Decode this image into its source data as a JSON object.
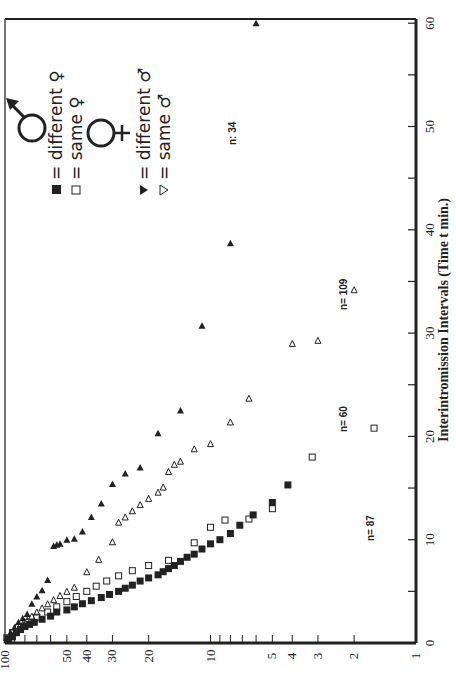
{
  "chart_data": {
    "type": "scatter",
    "orientation": "rotated 90° clockwise (time axis vertical on right edge, percent axis horizontal along bottom)",
    "title": "",
    "xlabel": "Interintromission Intervals (Time t min.)",
    "ylabel": "",
    "xlim": [
      0,
      60
    ],
    "ylim": [
      1,
      100
    ],
    "yscale": "log",
    "x_ticks": [
      0,
      10,
      20,
      30,
      40,
      50,
      60
    ],
    "y_ticks": [
      100,
      50,
      40,
      30,
      20,
      10,
      5,
      4,
      3,
      2,
      1
    ],
    "grid": false,
    "legend": [
      {
        "symbol": "filled-square",
        "label": "= different ♀",
        "group": "male"
      },
      {
        "symbol": "open-square",
        "label": "= same ♀",
        "group": "male"
      },
      {
        "symbol": "filled-triangle",
        "label": "= different ♂",
        "group": "female"
      },
      {
        "symbol": "open-triangle",
        "label": "= same ♂",
        "group": "female"
      }
    ],
    "annotations": [
      "n= 87",
      "n= 60",
      "n=109",
      "n= 34"
    ],
    "series": [
      {
        "name": "different ♀ (male)",
        "marker": "filled-square",
        "n": 87,
        "x": [
          0.3,
          0.6,
          1,
          1.3,
          1.6,
          1.8,
          2,
          2.3,
          2.6,
          3,
          3.2,
          3.5,
          3.8,
          4.1,
          4.4,
          4.7,
          5,
          5.3,
          5.6,
          6,
          6.3,
          6.6,
          6.9,
          7.2,
          7.5,
          7.9,
          8.3,
          8.6,
          9.1,
          9.6,
          10,
          10.6,
          11.4,
          12.4,
          13.6,
          15.3
        ],
        "y": [
          96,
          92,
          88,
          84,
          80,
          76,
          72,
          66,
          60,
          56,
          50,
          46,
          42,
          38,
          34,
          31,
          28,
          26,
          24,
          22,
          20,
          18,
          17,
          16,
          15,
          14,
          13,
          12,
          11,
          10,
          9,
          8,
          7.2,
          6.2,
          5,
          4.2
        ]
      },
      {
        "name": "same ♀ (male)",
        "marker": "open-square",
        "n": 60,
        "x": [
          0.5,
          1,
          1.5,
          2,
          2.5,
          3,
          3.5,
          4,
          4.5,
          5,
          5.5,
          6,
          6.5,
          7,
          7.5,
          8,
          9.7,
          11.2,
          11.9,
          12,
          13,
          18,
          20.8
        ],
        "y": [
          98,
          92,
          86,
          78,
          70,
          62,
          56,
          50,
          45,
          40,
          36,
          32,
          28,
          24,
          20,
          16,
          12,
          10,
          8.5,
          6.5,
          5,
          3.2,
          1.6
        ]
      },
      {
        "name": "different ♂ (female)",
        "marker": "filled-triangle",
        "n": 34,
        "x": [
          0.5,
          1,
          1.5,
          2,
          2.4,
          2.8,
          3.8,
          4.5,
          5.1,
          6.1,
          9.4,
          9.5,
          9.6,
          10,
          10.1,
          10.8,
          12.2,
          13.5,
          15.4,
          16.4,
          17,
          20.3,
          22.5,
          30.7,
          38.7,
          60
        ],
        "y": [
          98,
          94,
          90,
          86,
          82,
          78,
          74,
          70,
          66,
          62,
          58,
          56,
          54,
          50,
          46,
          42,
          38,
          34,
          30,
          26,
          22,
          18,
          14,
          11,
          8,
          6
        ]
      },
      {
        "name": "same ♂ (female)",
        "marker": "open-triangle",
        "n": 109,
        "x": [
          0.3,
          0.7,
          1,
          1.4,
          1.8,
          2.2,
          2.6,
          3,
          3.4,
          3.8,
          4.2,
          4.6,
          5,
          5.4,
          6.9,
          8.1,
          9.8,
          11.7,
          12.2,
          12.8,
          13.4,
          14,
          14.6,
          15.1,
          16.6,
          17.3,
          17.6,
          18.8,
          19.3,
          21.4,
          23.7,
          29,
          29.3,
          34.2
        ],
        "y": [
          98,
          94,
          90,
          86,
          82,
          78,
          74,
          70,
          66,
          62,
          58,
          54,
          50,
          46,
          40,
          35,
          30,
          28,
          26,
          24,
          22,
          20,
          18,
          17,
          16,
          15,
          14,
          12,
          10,
          8,
          6.5,
          4,
          3,
          2
        ]
      }
    ]
  },
  "axis": {
    "time_label": "Interintromission Intervals (Time t min.)",
    "time_ticks": [
      "0",
      "10",
      "20",
      "30",
      "40",
      "50",
      "60"
    ],
    "pct_ticks": [
      "100",
      "50",
      "40",
      "30",
      "20",
      "10",
      "5",
      "4",
      "3",
      "2",
      "1"
    ]
  },
  "legend": {
    "male_symbol": "♂",
    "female_symbol": "♀",
    "item1": "= different ♀",
    "item2": "= same ♀",
    "item3": "= different ♂",
    "item4": "= same ♂"
  },
  "labels": {
    "n87": "n= 87",
    "n60": "n= 60",
    "n109": "n= 109",
    "n34": "n: 34"
  }
}
